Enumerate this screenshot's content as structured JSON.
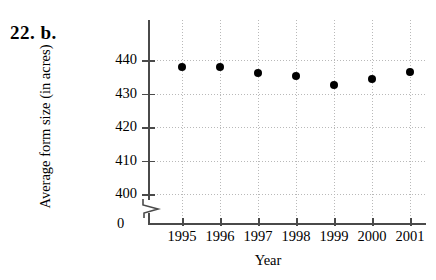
{
  "problem": {
    "label": "22.  b."
  },
  "chart_data": {
    "type": "scatter",
    "title": "",
    "xlabel": "Year",
    "ylabel": "Average form size (in acres)",
    "categories": [
      1995,
      1996,
      1997,
      1998,
      1999,
      2000,
      2001
    ],
    "x": [
      "1995",
      "1996",
      "1997",
      "1998",
      "1999",
      "2000",
      "2001"
    ],
    "values": [
      438.0,
      438.0,
      436.0,
      435.2,
      432.5,
      434.3,
      436.3
    ],
    "series": [
      {
        "name": "Average farm size",
        "values": [
          438.0,
          438.0,
          436.0,
          435.2,
          432.5,
          434.3,
          436.3
        ]
      }
    ],
    "ylim": [
      400,
      443
    ],
    "yticks": [
      "400",
      "410",
      "420",
      "430",
      "440"
    ],
    "ytick_values": [
      400,
      410,
      420,
      430,
      440
    ],
    "y_origin_label": "0",
    "axis_break": true,
    "grid": true,
    "grid_style": "dotted",
    "legend": "none",
    "marker": "filled-circle",
    "marker_color": "#000000",
    "axis_color": "#4a4a4a"
  }
}
